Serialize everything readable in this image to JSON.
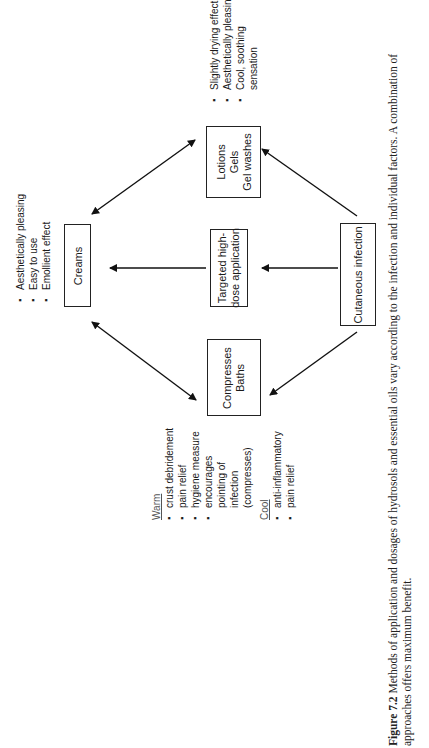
{
  "figure": {
    "caption_label": "Figure 7.2",
    "caption_text": "Methods of application and dosages of hydrosols and essential oils vary according to the infection and individual factors. A combination of approaches offers maximum benefit."
  },
  "nodes": {
    "creams": {
      "label": "Creams"
    },
    "targeted": {
      "line1": "Targeted high-",
      "line2": "dose application"
    },
    "cutaneous": {
      "label": "Cutaneous infection"
    },
    "lotions": {
      "line1": "Lotions",
      "line2": "Gels",
      "line3": "Gel washes"
    },
    "compresses": {
      "line1": "Compresses",
      "line2": "Baths"
    }
  },
  "notes": {
    "creams": [
      "Aesthetically pleasing",
      "Easy to use",
      "Emollient effect"
    ],
    "lotions": [
      "Slightly drying effect",
      "Aesthetically pleasing",
      "Cool, soothing",
      "sensation"
    ],
    "compresses": {
      "warm_heading": "Warm",
      "warm": [
        "crust debridement",
        "pain relief",
        "hygiene measure",
        "encourages",
        "pointing of",
        "infection",
        "(compresses)"
      ],
      "cool_heading": "Cool",
      "cool": [
        "anti-inflammatory",
        "pain relief"
      ]
    }
  },
  "edges": [
    {
      "from": "cutaneous",
      "to": "targeted",
      "type": "arrow"
    },
    {
      "from": "targeted",
      "to": "creams",
      "type": "arrow"
    },
    {
      "from": "cutaneous",
      "to": "lotions",
      "type": "arrow"
    },
    {
      "from": "cutaneous",
      "to": "compresses",
      "type": "arrow"
    },
    {
      "from": "creams",
      "to": "lotions",
      "type": "double-arrow"
    },
    {
      "from": "creams",
      "to": "compresses",
      "type": "double-arrow"
    }
  ]
}
